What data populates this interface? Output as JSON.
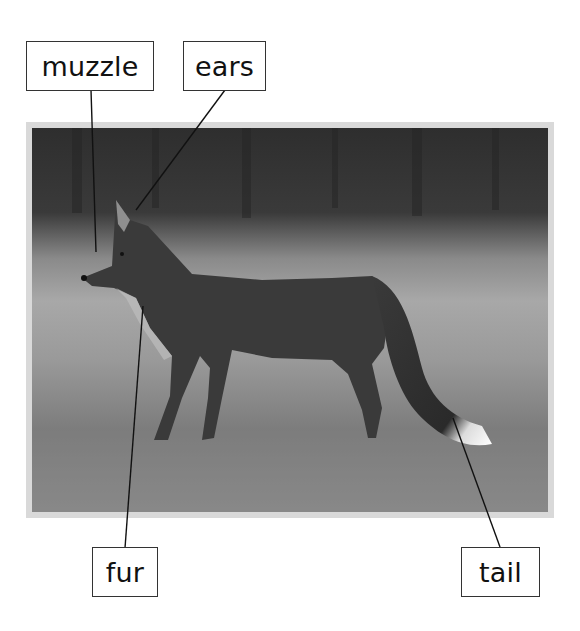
{
  "diagram": {
    "labels": [
      {
        "id": "muzzle",
        "text": "muzzle"
      },
      {
        "id": "ears",
        "text": "ears"
      },
      {
        "id": "fur",
        "text": "fur"
      },
      {
        "id": "tail",
        "text": "tail"
      }
    ]
  },
  "colors": {
    "frame": "#d9d9d9",
    "label_border": "#333333",
    "leader_line": "#111111"
  }
}
